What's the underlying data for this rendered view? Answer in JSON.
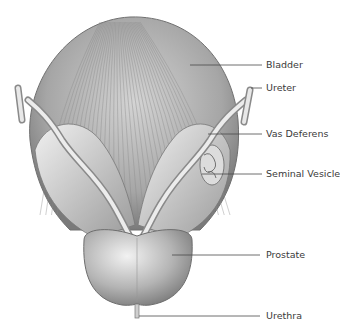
{
  "diagram": {
    "labels": [
      {
        "id": "bladder",
        "text": "Bladder"
      },
      {
        "id": "ureter",
        "text": "Ureter"
      },
      {
        "id": "vas-deferens",
        "text": "Vas Deferens"
      },
      {
        "id": "seminal-vesicle",
        "text": "Seminal Vesicle"
      },
      {
        "id": "prostate",
        "text": "Prostate"
      },
      {
        "id": "urethra",
        "text": "Urethra"
      }
    ],
    "colors": {
      "background": "#ffffff",
      "leader_line": "#4a4a4a",
      "label_text": "#3a3a3a",
      "tissue_dark": "#6e6e6e",
      "tissue_mid": "#a8a8a8",
      "tissue_light": "#e6e6e6"
    }
  }
}
